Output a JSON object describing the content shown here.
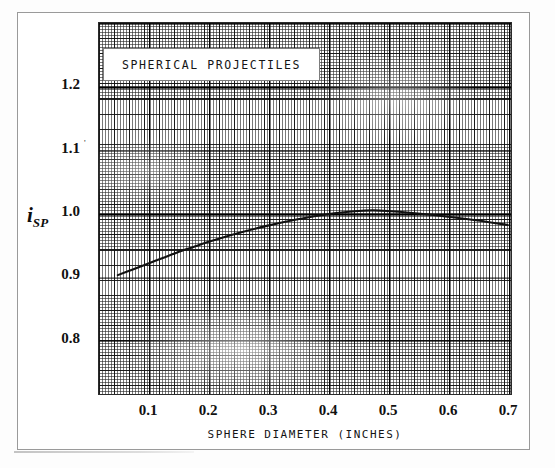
{
  "figure": {
    "kind": "scanned-engineering-graph"
  },
  "chart_data": {
    "type": "line",
    "title": "SPHERICAL PROJECTILES",
    "xlabel": "SPHERE DIAMETER (INCHES)",
    "ylabel": "i",
    "ylabel_subscript": "SP",
    "xlim": [
      0.017,
      0.707
    ],
    "ylim": [
      0.714,
      1.302
    ],
    "grid": true,
    "grid_style": "engineering graph paper, fine minor lines with heavier every 5th line",
    "legend": "none",
    "xticks": [
      "0.1",
      "0.2",
      "0.3",
      "0.4",
      "0.5",
      "0.6",
      "0.7"
    ],
    "xtick_values": [
      0.1,
      0.2,
      0.3,
      0.4,
      0.5,
      0.6,
      0.7
    ],
    "yticks": [
      "1.2",
      "1.1",
      "1.0",
      "0.9",
      "0.8"
    ],
    "ytick_values": [
      1.2,
      1.1,
      1.0,
      0.9,
      0.8
    ],
    "series": [
      {
        "name": "i_SP vs sphere diameter",
        "x": [
          0.05,
          0.075,
          0.1,
          0.125,
          0.15,
          0.175,
          0.2,
          0.25,
          0.3,
          0.35,
          0.4,
          0.45,
          0.475,
          0.5,
          0.55,
          0.6,
          0.65,
          0.7
        ],
        "y": [
          0.903,
          0.912,
          0.921,
          0.93,
          0.939,
          0.947,
          0.955,
          0.969,
          0.981,
          0.991,
          0.999,
          1.004,
          1.005,
          1.004,
          1.0,
          0.995,
          0.989,
          0.982
        ]
      }
    ],
    "annotations": [
      {
        "text": "SPHERICAL PROJECTILES",
        "type": "title-plaque",
        "x": 0.25,
        "y": 1.24
      }
    ]
  }
}
